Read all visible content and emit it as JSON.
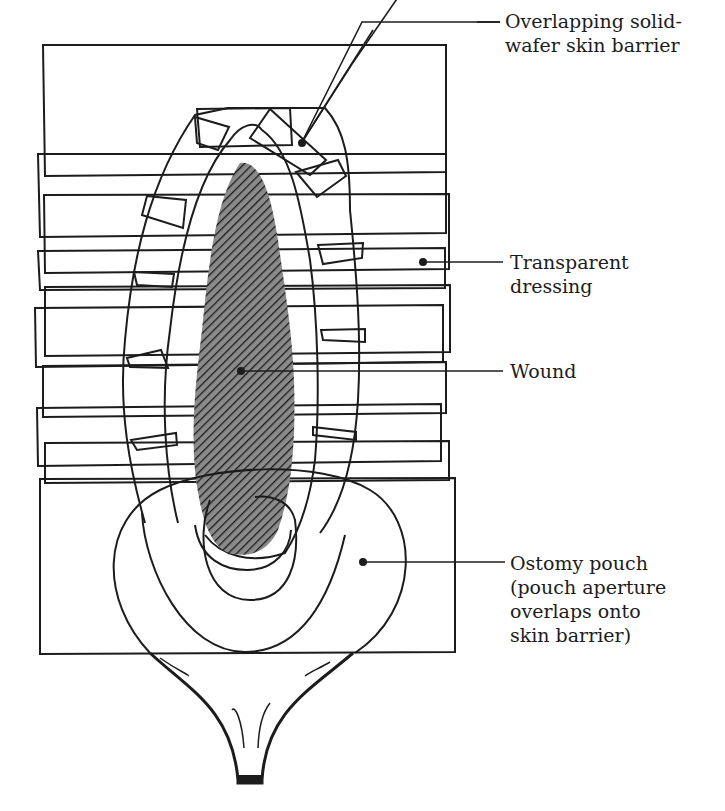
{
  "figure": {
    "type": "medical illustration"
  },
  "labels": {
    "skin_barrier": [
      "Overlapping solid-",
      "wafer skin barrier"
    ],
    "transparent_dressing": [
      "Transparent",
      "dressing"
    ],
    "wound": [
      "Wound"
    ],
    "ostomy_pouch": [
      "Ostomy pouch",
      "(pouch aperture",
      "overlaps onto",
      "skin barrier)"
    ]
  },
  "colors": {
    "ink": "#1c1c1c",
    "wound_fill": "#6a6a6a",
    "background": "#ffffff"
  }
}
